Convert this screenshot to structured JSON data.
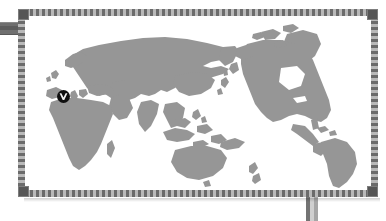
{
  "graphic": {
    "kind": "world-map-object",
    "title": "World Map",
    "projection": "Pacific-centered equirectangular",
    "selected": true
  },
  "frame": {
    "style": "dashed-selection-border",
    "border_color": "#6b6b6b",
    "border_color_light": "#b9b9b9",
    "handle_color": "#565656",
    "handles": [
      {
        "name": "top-left",
        "label": ""
      },
      {
        "name": "top-right",
        "label": ""
      },
      {
        "name": "bottom-left",
        "label": ""
      },
      {
        "name": "bottom-right",
        "label": ""
      }
    ]
  },
  "connectors": [
    {
      "name": "left-tab",
      "edge": "left",
      "color": "#6f6f6f"
    },
    {
      "name": "bottom-stem",
      "edge": "bottom",
      "color": "#8d8d8d"
    }
  ],
  "map": {
    "land_color": "#969696",
    "ocean_color": "#ffffff",
    "regions": [
      "Europe",
      "Africa",
      "Asia",
      "Siberia",
      "Arabian Peninsula",
      "India",
      "Indonesia",
      "Australia",
      "New Zealand",
      "Japan",
      "Greenland",
      "North America",
      "South America"
    ]
  },
  "marker": {
    "name": "location-marker",
    "shape": "circle",
    "background": "#101010",
    "glyph": "v-check-glyph",
    "glyph_color": "#f2f2f2",
    "located_over": "Mediterranean / Southern Europe",
    "label": ""
  }
}
